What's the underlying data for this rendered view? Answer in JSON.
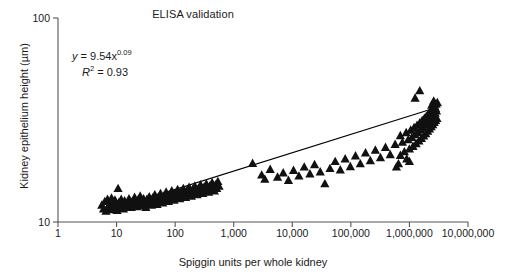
{
  "chart_data": {
    "type": "scatter",
    "title": "ELISA validation",
    "xlabel": "Spiggin units per whole kidney",
    "ylabel": "Kidney epithelium height (µm)",
    "xscale": "log",
    "yscale": "log",
    "xlim": [
      1,
      10000000
    ],
    "ylim": [
      10,
      100
    ],
    "grid": false,
    "legend": null,
    "xticks": [
      1,
      10,
      100,
      1000,
      10000,
      100000,
      1000000,
      10000000
    ],
    "xticklabels": [
      "1",
      "10",
      "100",
      "1,000",
      "10,000",
      "100,000",
      "1,000,000",
      "10,000,000"
    ],
    "yticks": [
      10,
      100
    ],
    "yticklabels": [
      "10",
      "100"
    ],
    "marker": "filled-triangle",
    "marker_color": "#111111",
    "annotations": {
      "equation_y": "y",
      "equation_body": " = 9.54x",
      "equation_exp": "0.09",
      "r2_symbol": "R",
      "r2_sup": "2",
      "r2_value": " = 0.93"
    },
    "fit": {
      "type": "power",
      "equation": "y = 9.54x^0.09",
      "coefficient": 9.54,
      "exponent": 0.09,
      "r_squared": 0.93,
      "line_color": "#000000",
      "x_start": 6,
      "x_end": 3000000
    },
    "series": [
      {
        "name": "Kidney epithelium height vs spiggin units",
        "points": [
          [
            5.6,
            12.1
          ],
          [
            6.0,
            11.6
          ],
          [
            6.3,
            12.6
          ],
          [
            6.6,
            11.3
          ],
          [
            7.0,
            12.9
          ],
          [
            7.2,
            11.9
          ],
          [
            7.6,
            12.3
          ],
          [
            7.9,
            11.5
          ],
          [
            8.2,
            13.1
          ],
          [
            8.6,
            12.0
          ],
          [
            9.0,
            11.7
          ],
          [
            9.4,
            12.8
          ],
          [
            9.8,
            12.2
          ],
          [
            10.2,
            11.4
          ],
          [
            10.6,
            14.6
          ],
          [
            11.0,
            12.5
          ],
          [
            11.5,
            11.8
          ],
          [
            12.0,
            12.9
          ],
          [
            12.6,
            12.1
          ],
          [
            13.1,
            11.6
          ],
          [
            13.7,
            12.7
          ],
          [
            14.3,
            12.2
          ],
          [
            15.0,
            11.9
          ],
          [
            15.6,
            12.4
          ],
          [
            16.3,
            13.0
          ],
          [
            17.0,
            12.2
          ],
          [
            17.8,
            11.8
          ],
          [
            18.6,
            12.6
          ],
          [
            19.4,
            12.0
          ],
          [
            20.3,
            13.2
          ],
          [
            21.2,
            12.4
          ],
          [
            22.2,
            11.9
          ],
          [
            23.2,
            12.8
          ],
          [
            24.2,
            12.3
          ],
          [
            25.3,
            13.4
          ],
          [
            26.5,
            12.6
          ],
          [
            27.7,
            12.0
          ],
          [
            28.9,
            13.0
          ],
          [
            30.2,
            12.5
          ],
          [
            31.6,
            11.8
          ],
          [
            33.0,
            12.9
          ],
          [
            34.5,
            12.3
          ],
          [
            36.1,
            13.3
          ],
          [
            37.7,
            12.7
          ],
          [
            39.4,
            12.1
          ],
          [
            41.2,
            13.1
          ],
          [
            43.1,
            12.5
          ],
          [
            45.0,
            13.6
          ],
          [
            47.1,
            12.8
          ],
          [
            49.2,
            12.2
          ],
          [
            51.4,
            13.2
          ],
          [
            53.8,
            12.6
          ],
          [
            56.2,
            13.8
          ],
          [
            58.8,
            13.0
          ],
          [
            61.4,
            12.4
          ],
          [
            64.2,
            13.4
          ],
          [
            67.1,
            12.8
          ],
          [
            70.2,
            14.0
          ],
          [
            73.4,
            13.2
          ],
          [
            76.7,
            12.6
          ],
          [
            80.2,
            13.6
          ],
          [
            83.8,
            13.0
          ],
          [
            87.6,
            14.2
          ],
          [
            91.6,
            13.4
          ],
          [
            95.8,
            12.8
          ],
          [
            100.0,
            13.8
          ],
          [
            105.0,
            13.2
          ],
          [
            110.0,
            14.4
          ],
          [
            115.0,
            13.6
          ],
          [
            120.0,
            13.0
          ],
          [
            126.0,
            14.0
          ],
          [
            132.0,
            13.4
          ],
          [
            138.0,
            14.6
          ],
          [
            144.0,
            13.8
          ],
          [
            151.0,
            13.2
          ],
          [
            158.0,
            14.2
          ],
          [
            165.0,
            13.6
          ],
          [
            173.0,
            14.8
          ],
          [
            181.0,
            14.0
          ],
          [
            189.0,
            13.4
          ],
          [
            198.0,
            14.4
          ],
          [
            207.0,
            13.8
          ],
          [
            217.0,
            15.0
          ],
          [
            227.0,
            14.2
          ],
          [
            237.0,
            13.6
          ],
          [
            248.0,
            14.6
          ],
          [
            260.0,
            14.0
          ],
          [
            272.0,
            15.2
          ],
          [
            284.0,
            14.4
          ],
          [
            298.0,
            13.8
          ],
          [
            311.0,
            14.8
          ],
          [
            326.0,
            14.2
          ],
          [
            341.0,
            15.4
          ],
          [
            357.0,
            14.6
          ],
          [
            373.0,
            14.0
          ],
          [
            390.0,
            15.0
          ],
          [
            409.0,
            14.4
          ],
          [
            428.0,
            15.6
          ],
          [
            447.0,
            14.8
          ],
          [
            468.0,
            14.2
          ],
          [
            490.0,
            15.2
          ],
          [
            512.0,
            14.6
          ],
          [
            536.0,
            15.8
          ],
          [
            561.0,
            15.0
          ],
          [
            2100.0,
            19.4
          ],
          [
            3000.0,
            17.0
          ],
          [
            3400.0,
            16.2
          ],
          [
            4200.0,
            18.1
          ],
          [
            5600.0,
            16.6
          ],
          [
            7000.0,
            17.4
          ],
          [
            8600.0,
            16.0
          ],
          [
            10500.0,
            17.9
          ],
          [
            13000.0,
            16.8
          ],
          [
            16000.0,
            18.6
          ],
          [
            20000.0,
            17.2
          ],
          [
            24000.0,
            19.1
          ],
          [
            30000.0,
            17.6
          ],
          [
            36000.0,
            15.4
          ],
          [
            44000.0,
            18.3
          ],
          [
            54000.0,
            19.8
          ],
          [
            66000.0,
            18.0
          ],
          [
            80000.0,
            20.4
          ],
          [
            98000.0,
            18.7
          ],
          [
            120000.0,
            21.1
          ],
          [
            145000.0,
            19.3
          ],
          [
            178000.0,
            21.8
          ],
          [
            215000.0,
            20.0
          ],
          [
            262000.0,
            22.5
          ],
          [
            320000.0,
            20.7
          ],
          [
            390000.0,
            23.2
          ],
          [
            470000.0,
            21.4
          ],
          [
            570000.0,
            24.0
          ],
          [
            600000.0,
            18.6
          ],
          [
            650000.0,
            19.3
          ],
          [
            700000.0,
            26.5
          ],
          [
            760000.0,
            24.6
          ],
          [
            820000.0,
            22.1
          ],
          [
            880000.0,
            27.4
          ],
          [
            950000.0,
            25.3
          ],
          [
            1000000.0,
            22.8
          ],
          [
            1050000.0,
            28.2
          ],
          [
            1100000.0,
            26.0
          ],
          [
            1150000.0,
            23.5
          ],
          [
            1200000.0,
            29.0
          ],
          [
            1250000.0,
            26.8
          ],
          [
            1300000.0,
            24.2
          ],
          [
            1350000.0,
            29.8
          ],
          [
            1400000.0,
            27.5
          ],
          [
            1450000.0,
            25.0
          ],
          [
            1500000.0,
            30.6
          ],
          [
            1550000.0,
            28.3
          ],
          [
            1600000.0,
            25.7
          ],
          [
            1650000.0,
            31.4
          ],
          [
            1700000.0,
            29.0
          ],
          [
            1750000.0,
            26.4
          ],
          [
            1800000.0,
            32.2
          ],
          [
            1850000.0,
            29.8
          ],
          [
            1900000.0,
            27.1
          ],
          [
            1950000.0,
            33.0
          ],
          [
            2000000.0,
            30.5
          ],
          [
            2050000.0,
            27.9
          ],
          [
            2100000.0,
            33.8
          ],
          [
            2150000.0,
            31.2
          ],
          [
            2200000.0,
            28.6
          ],
          [
            2250000.0,
            34.6
          ],
          [
            2300000.0,
            32.0
          ],
          [
            2350000.0,
            29.3
          ],
          [
            2400000.0,
            35.4
          ],
          [
            2450000.0,
            32.7
          ],
          [
            2500000.0,
            30.0
          ],
          [
            2550000.0,
            36.2
          ],
          [
            2600000.0,
            33.5
          ],
          [
            2650000.0,
            30.8
          ],
          [
            2700000.0,
            37.0
          ],
          [
            2750000.0,
            34.2
          ],
          [
            2800000.0,
            31.5
          ],
          [
            2850000.0,
            37.8
          ],
          [
            2900000.0,
            35.0
          ],
          [
            2950000.0,
            32.2
          ],
          [
            3000000.0,
            38.5
          ],
          [
            1500000.0,
            44.0
          ],
          [
            1250000.0,
            40.5
          ],
          [
            900000.0,
            20.4
          ],
          [
            1000000.0,
            19.8
          ],
          [
            700000.0,
            21.2
          ],
          [
            2800000.0,
            36.0
          ],
          [
            2600000.0,
            39.2
          ],
          [
            2400000.0,
            37.4
          ]
        ]
      }
    ]
  }
}
